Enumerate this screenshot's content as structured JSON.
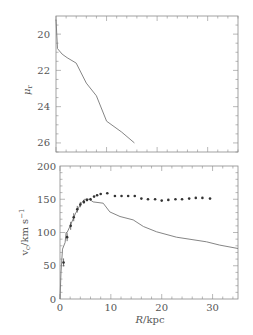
{
  "chart_data": [
    {
      "type": "line",
      "panel": "top",
      "title": "",
      "xlabel": "",
      "ylabel": "μ_r",
      "xlim": [
        0,
        36
      ],
      "ylim": [
        26.5,
        19.0
      ],
      "y_inverted": true,
      "yticks": [
        20,
        22,
        24,
        26
      ],
      "ytick_labels": [
        "20",
        "22",
        "24",
        "26"
      ],
      "series": [
        {
          "name": "surface brightness profile",
          "x": [
            0.0,
            0.3,
            1.2,
            2.2,
            4.0,
            6.0,
            8.0,
            10.0,
            13.0,
            15.5
          ],
          "y": [
            19.2,
            20.8,
            21.1,
            21.3,
            21.6,
            22.7,
            23.4,
            24.8,
            25.4,
            26.0
          ]
        }
      ]
    },
    {
      "type": "line",
      "panel": "bottom",
      "title": "",
      "xlabel": "R/kpc",
      "ylabel": "v_c/km s^-1",
      "xlim": [
        0,
        35
      ],
      "ylim": [
        0,
        200
      ],
      "xticks": [
        0,
        10,
        20,
        30
      ],
      "xtick_labels": [
        "0",
        "10",
        "20",
        "30"
      ],
      "yticks": [
        0,
        50,
        100,
        150,
        200
      ],
      "ytick_labels": [
        "0",
        "50",
        "100",
        "150",
        "200"
      ],
      "series": [
        {
          "name": "model rotation curve",
          "style": "line",
          "x": [
            0.0,
            0.2,
            0.5,
            1.0,
            1.2,
            1.4,
            2.0,
            3.0,
            4.0,
            4.8,
            5.8,
            6.5,
            8.5,
            9.8,
            11.8,
            14.4,
            16.4,
            19.0,
            22.9,
            28.8,
            31.4,
            35.0
          ],
          "y": [
            0,
            40,
            75,
            85,
            100,
            100,
            110,
            128,
            142,
            150,
            150,
            146,
            144,
            131,
            124,
            119,
            109,
            101,
            93,
            86,
            81,
            76
          ]
        },
        {
          "name": "observed rotation velocities",
          "style": "points",
          "x": [
            0.7,
            1.4,
            2.1,
            2.7,
            3.4,
            4.0,
            4.7,
            5.3,
            6.0,
            6.7,
            7.3,
            8.0,
            9.3,
            10.8,
            12.1,
            13.4,
            14.7,
            16.0,
            17.3,
            18.7,
            20.0,
            21.3,
            22.7,
            24.0,
            25.4,
            26.7,
            28.0,
            29.5
          ],
          "y": [
            55,
            93,
            110,
            123,
            135,
            142,
            146,
            149,
            150,
            154,
            156,
            158,
            159,
            155,
            155,
            155,
            155,
            151,
            150,
            150,
            148,
            149,
            150,
            150,
            151,
            152,
            152,
            151
          ],
          "yerr": [
            6,
            6,
            6,
            6,
            5,
            4,
            3,
            2,
            2,
            0,
            0,
            0,
            0,
            0,
            0,
            0,
            0,
            0,
            0,
            0,
            0,
            0,
            0,
            0,
            0,
            0,
            0,
            0
          ]
        }
      ]
    }
  ],
  "labels": {
    "top_ylabel_main": "μ",
    "top_ylabel_sub": "r",
    "bottom_ylabel_v": "v",
    "bottom_ylabel_sub": "c",
    "bottom_ylabel_rest": "/km s",
    "bottom_ylabel_sup": "−1",
    "bottom_xlabel_var": "R",
    "bottom_xlabel_rest": "/kpc"
  }
}
